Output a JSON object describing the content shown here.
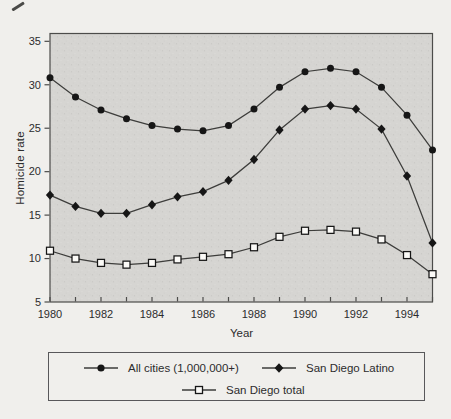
{
  "figure": {
    "y_axis_label": "Homicide rate",
    "x_axis_label": "Year"
  },
  "legend": {
    "items": [
      {
        "label": "All cities (1,000,000+)",
        "marker": "filled-circle"
      },
      {
        "label": "San Diego Latino",
        "marker": "filled-diamond"
      },
      {
        "label": "San Diego total",
        "marker": "open-square"
      }
    ]
  },
  "colors": {
    "plot_background": "#d6d5d2",
    "axis": "#4c4c4a",
    "line": "#3d3d3b",
    "marker_fill": "#161616",
    "open_marker_fill": "#fbfaf7",
    "text": "#2c2c2c",
    "page_background": "#f0efec"
  },
  "chart_data": {
    "type": "line",
    "title": "",
    "xlabel": "Year",
    "ylabel": "Homicide rate",
    "x": [
      1980,
      1981,
      1982,
      1983,
      1984,
      1985,
      1986,
      1987,
      1988,
      1989,
      1990,
      1991,
      1992,
      1993,
      1994,
      1995
    ],
    "x_tick_labels": [
      1980,
      1982,
      1984,
      1986,
      1988,
      1990,
      1992,
      1994
    ],
    "y_ticks": [
      5,
      10,
      15,
      20,
      25,
      30,
      35
    ],
    "xlim": [
      1980,
      1995
    ],
    "ylim": [
      5,
      35.9
    ],
    "grid": false,
    "legend_position": "bottom-box",
    "plot_background": "stippled-gray",
    "series": [
      {
        "name": "All cities (1,000,000+)",
        "marker": "filled-circle",
        "values": [
          30.8,
          28.6,
          27.1,
          26.1,
          25.3,
          24.9,
          24.7,
          25.3,
          27.2,
          29.7,
          31.5,
          31.9,
          31.5,
          29.7,
          26.5,
          22.5
        ]
      },
      {
        "name": "San Diego Latino",
        "marker": "filled-diamond",
        "values": [
          17.3,
          16.0,
          15.2,
          15.2,
          16.2,
          17.1,
          17.7,
          19.0,
          21.4,
          24.8,
          27.2,
          27.6,
          27.2,
          24.9,
          19.5,
          11.8
        ]
      },
      {
        "name": "San Diego total",
        "marker": "open-square",
        "values": [
          10.9,
          10.0,
          9.5,
          9.3,
          9.5,
          9.9,
          10.2,
          10.5,
          11.3,
          12.5,
          13.2,
          13.3,
          13.1,
          12.2,
          10.4,
          8.2
        ]
      }
    ]
  }
}
